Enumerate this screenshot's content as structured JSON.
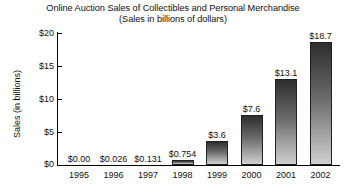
{
  "chart_data": {
    "type": "bar",
    "title": "Online Auction Sales of Collectibles and Personal Merchandise",
    "subtitle": "(Sales in billions of dollars)",
    "xlabel": "",
    "ylabel": "Sales (in billions)",
    "ylim": [
      0,
      20
    ],
    "grid": false,
    "legend": null,
    "ytick_labels": [
      "$0",
      "$5",
      "$10",
      "$15",
      "$20"
    ],
    "ytick_values": [
      0,
      5,
      10,
      15,
      20
    ],
    "categories": [
      "1995",
      "1996",
      "1997",
      "1998",
      "1999",
      "2000",
      "2001",
      "2002"
    ],
    "values": [
      0.0,
      0.026,
      0.131,
      0.754,
      3.6,
      7.6,
      13.1,
      18.7
    ],
    "value_labels": [
      "$0.00",
      "$0.026",
      "$0.131",
      "$0.754",
      "$3.6",
      "$7.6",
      "$13.1",
      "$18.7"
    ],
    "bar_fill_top_color": "#2f2f2f",
    "bar_fill_bottom_color": "#cfcfcf",
    "bar_edge_color": "#202020",
    "axis_color": "#000000",
    "background_color": "#ffffff"
  }
}
